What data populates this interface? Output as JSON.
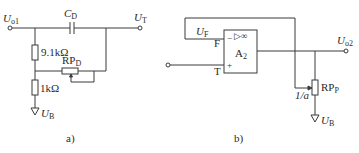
{
  "figure": {
    "panels": [
      {
        "id": "a",
        "caption": "a)",
        "terminals": {
          "input": {
            "symbol": "U",
            "subscript": "o1"
          },
          "output": {
            "symbol": "U",
            "subscript": "T"
          },
          "ground": {
            "symbol": "U",
            "subscript": "B"
          }
        },
        "components": {
          "capacitor": {
            "symbol": "C",
            "subscript": "D"
          },
          "resistor_top": {
            "value": "9.1kΩ"
          },
          "resistor_bottom": {
            "value": "1kΩ"
          },
          "potentiometer": {
            "symbol": "RP",
            "subscript": "D"
          }
        }
      },
      {
        "id": "b",
        "caption": "b)",
        "terminals": {
          "output": {
            "symbol": "U",
            "subscript": "o2"
          },
          "ground": {
            "symbol": "U",
            "subscript": "B"
          },
          "feedback": {
            "symbol": "U",
            "subscript": "F"
          }
        },
        "opamp": {
          "name": "A",
          "name_sub": "2",
          "gain_symbol": "▷∞",
          "inverting_pin": "F",
          "noninverting_pin": "T",
          "minus_sign": "−",
          "plus_sign": "+"
        },
        "components": {
          "potentiometer": {
            "symbol": "RP",
            "subscript": "P"
          },
          "wiper_ratio": "1/a"
        }
      }
    ]
  }
}
